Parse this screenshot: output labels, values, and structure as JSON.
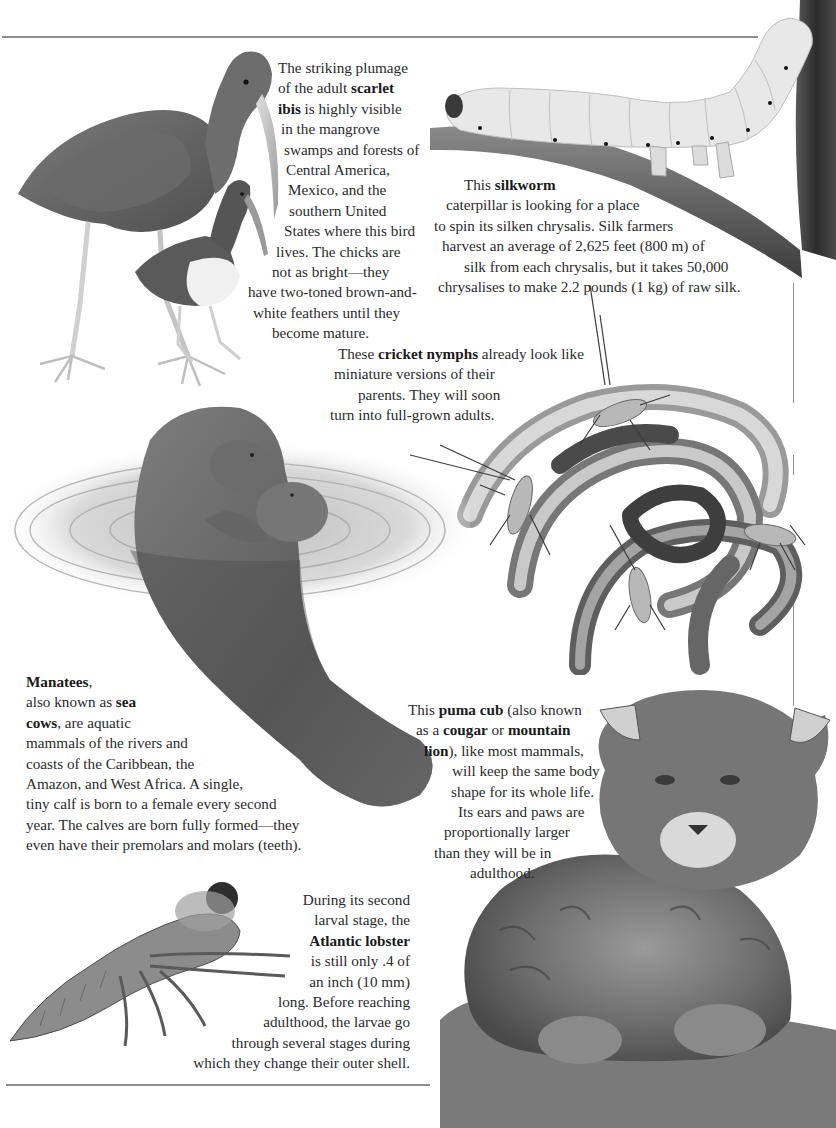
{
  "page": {
    "type": "book-spread-page",
    "palette": {
      "background": "#ffffff",
      "text": "#2b2b2b",
      "rule": "#8e8e8e",
      "illustration_dark": "#4a4a4a",
      "illustration_mid": "#8a8a8a",
      "illustration_light": "#e6e6e6"
    }
  },
  "captions": {
    "ibis": {
      "subject": "scarlet ibis",
      "lines": [
        [
          "The striking plumage",
          ""
        ],
        [
          "of the adult ",
          "scarlet"
        ],
        [
          "",
          "ibis",
          " is highly visible"
        ],
        [
          "in the mangrove",
          ""
        ],
        [
          "swamps and forests of",
          ""
        ],
        [
          "Central America,",
          ""
        ],
        [
          "Mexico, and the",
          ""
        ],
        [
          "southern United",
          ""
        ],
        [
          "States where this bird",
          ""
        ],
        [
          "lives. The chicks are",
          ""
        ],
        [
          "not as bright—they",
          ""
        ],
        [
          "have two-toned brown-and-",
          ""
        ],
        [
          "white feathers until they",
          ""
        ],
        [
          "become mature.",
          ""
        ]
      ]
    },
    "silkworm": {
      "subject": "silkworm",
      "lines": [
        [
          "This ",
          "silkworm",
          ""
        ],
        [
          "caterpillar is looking for a place",
          "",
          ""
        ],
        [
          "to spin its silken chrysalis. Silk farmers",
          "",
          ""
        ],
        [
          "harvest an average of 2,625 feet (800 m) of",
          "",
          ""
        ],
        [
          "silk from each chrysalis, but it takes 50,000",
          "",
          ""
        ],
        [
          "chrysalises to make 2.2 pounds (1 kg) of raw silk.",
          "",
          ""
        ]
      ]
    },
    "cricket": {
      "subject": "cricket nymphs",
      "lines": [
        [
          "These ",
          "cricket nymphs",
          " already look like"
        ],
        [
          "miniature versions of their",
          "",
          ""
        ],
        [
          "parents. They will soon",
          "",
          ""
        ],
        [
          "turn into full-grown adults.",
          "",
          ""
        ]
      ]
    },
    "manatee": {
      "subject": "Manatees",
      "lines": [
        [
          "",
          "Manatees",
          ","
        ],
        [
          "also known as ",
          "sea",
          ""
        ],
        [
          "",
          "cows",
          ", are aquatic"
        ],
        [
          "mammals of the rivers and",
          "",
          ""
        ],
        [
          "coasts of the Caribbean, the",
          "",
          ""
        ],
        [
          "Amazon, and West Africa. A single,",
          "",
          ""
        ],
        [
          "tiny calf is born to a female every second",
          "",
          ""
        ],
        [
          "year. The calves are born fully formed—they",
          "",
          ""
        ],
        [
          "even have their premolars and molars (teeth).",
          "",
          ""
        ]
      ]
    },
    "puma": {
      "subject": "puma cub",
      "lines": [
        [
          "This ",
          "puma cub",
          " (also known"
        ],
        [
          "as a ",
          "cougar",
          " or ",
          "mountain"
        ],
        [
          "",
          "lion",
          "), like most mammals,"
        ],
        [
          "will keep the same body",
          "",
          ""
        ],
        [
          "shape for its whole life.",
          "",
          ""
        ],
        [
          "Its ears and paws are",
          "",
          ""
        ],
        [
          "proportionally larger",
          "",
          ""
        ],
        [
          "than they will be in",
          "",
          ""
        ],
        [
          "adulthood.",
          "",
          ""
        ]
      ]
    },
    "lobster": {
      "subject": "Atlantic lobster",
      "lines": [
        [
          "During its second",
          "",
          ""
        ],
        [
          "larval stage, the",
          "",
          ""
        ],
        [
          "",
          "Atlantic lobster",
          ""
        ],
        [
          "is still only .4 of",
          "",
          ""
        ],
        [
          "an inch (10 mm)",
          "",
          ""
        ],
        [
          "long. Before reaching",
          "",
          ""
        ],
        [
          "adulthood, the larvae go",
          "",
          ""
        ],
        [
          "through several stages during",
          "",
          ""
        ],
        [
          "which they change their outer shell.",
          "",
          ""
        ]
      ]
    }
  },
  "illustrations": [
    {
      "id": "scarlet-ibis",
      "label": "Adult scarlet ibis with chick"
    },
    {
      "id": "silkworm",
      "label": "Silkworm caterpillar on branch"
    },
    {
      "id": "cricket-nymphs",
      "label": "Cricket nymphs on coiled stems"
    },
    {
      "id": "manatee",
      "label": "Manatee with calf in water"
    },
    {
      "id": "puma-cub",
      "label": "Puma cub sitting"
    },
    {
      "id": "lobster-larva",
      "label": "Atlantic lobster larva"
    }
  ]
}
